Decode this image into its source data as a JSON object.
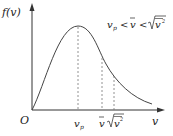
{
  "figure": {
    "y_axis_label": "f(v)",
    "x_axis_label": "v",
    "origin_label": "O",
    "annotation": {
      "v_p": "v",
      "v_p_sub": "p",
      "lt1": "<",
      "v_bar": "v",
      "lt2": "<",
      "v_rms": "v",
      "v_rms_sup": "2"
    },
    "tick_labels": {
      "v_p": "v",
      "v_p_sub": "p",
      "v_bar": "v",
      "v_rms": "v",
      "v_rms_sup": "2"
    },
    "colors": {
      "axis": "#333333",
      "curve": "#444444",
      "dashed": "#777777"
    }
  }
}
